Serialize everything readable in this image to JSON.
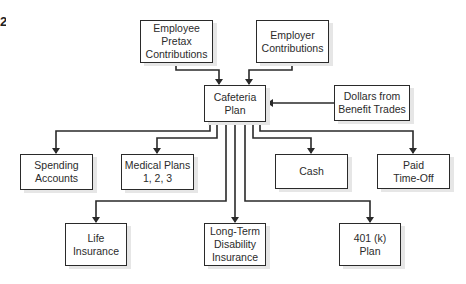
{
  "diagram": {
    "title_fragment": "2",
    "nodes": [
      {
        "id": "employee-pretax",
        "label": "Employee\nPretax\nContributions"
      },
      {
        "id": "employer",
        "label": "Employer\nContributions"
      },
      {
        "id": "cafeteria",
        "label": "Cafeteria\nPlan"
      },
      {
        "id": "benefit-trades",
        "label": "Dollars from\nBenefit Trades"
      },
      {
        "id": "spending",
        "label": "Spending\nAccounts"
      },
      {
        "id": "medical",
        "label": "Medical Plans\n1, 2, 3"
      },
      {
        "id": "cash",
        "label": "Cash"
      },
      {
        "id": "pto",
        "label": "Paid\nTime-Off"
      },
      {
        "id": "life",
        "label": "Life\nInsurance"
      },
      {
        "id": "ltd",
        "label": "Long-Term\nDisability\nInsurance"
      },
      {
        "id": "401k",
        "label": "401 (k)\nPlan"
      }
    ],
    "edges": [
      {
        "from": "employee-pretax",
        "to": "cafeteria"
      },
      {
        "from": "employer",
        "to": "cafeteria"
      },
      {
        "from": "benefit-trades",
        "to": "cafeteria"
      },
      {
        "from": "cafeteria",
        "to": "spending"
      },
      {
        "from": "cafeteria",
        "to": "medical"
      },
      {
        "from": "cafeteria",
        "to": "life"
      },
      {
        "from": "cafeteria",
        "to": "ltd"
      },
      {
        "from": "cafeteria",
        "to": "401k"
      },
      {
        "from": "cafeteria",
        "to": "cash"
      },
      {
        "from": "cafeteria",
        "to": "pto"
      }
    ],
    "colors": {
      "line": "#2a2a2a",
      "box_border": "#2a2a2a",
      "shadow": "#e6e6e6",
      "background": "#ffffff"
    }
  }
}
